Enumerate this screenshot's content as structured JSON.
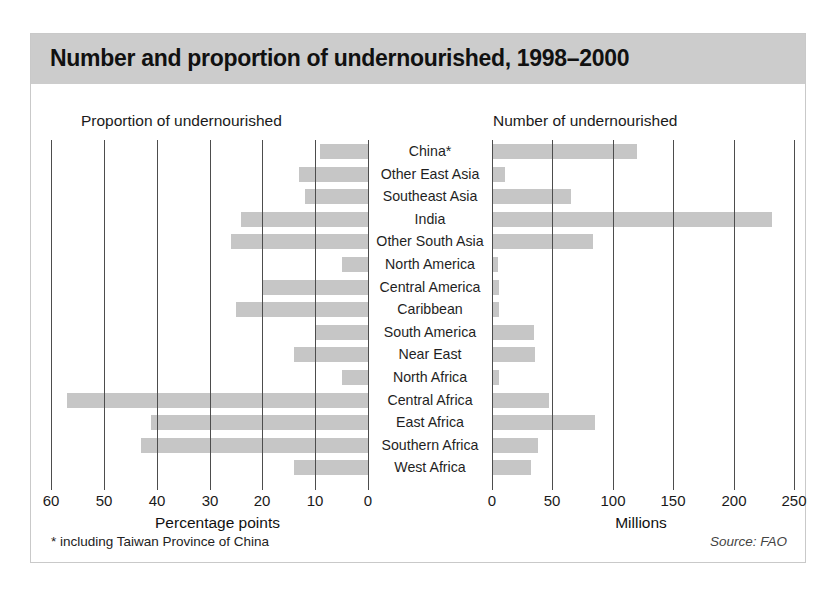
{
  "figure": {
    "title": "Number and proportion of undernourished, 1998–2000",
    "footnote": "* including Taiwan Province of China",
    "source": "Source: FAO",
    "title_band_color": "#cccccc",
    "bar_color": "#c6c6c6",
    "axis_color": "#4d4d4d"
  },
  "panels": {
    "left_heading": "Proportion of undernourished",
    "right_heading": "Number of undernourished"
  },
  "chart_data": {
    "type": "bar",
    "title": "Number and proportion of undernourished, 1998–2000",
    "orientation": "horizontal",
    "layout": "back-to-back bidirectional; left axis reversed, labels centered",
    "grid": true,
    "legend": null,
    "categories": [
      "China*",
      "Other East Asia",
      "Southeast Asia",
      "India",
      "Other South Asia",
      "North America",
      "Central America",
      "Caribbean",
      "South America",
      "Near East",
      "North Africa",
      "Central Africa",
      "East Africa",
      "Southern Africa",
      "West Africa"
    ],
    "series": [
      {
        "name": "Proportion of undernourished",
        "panel": "left",
        "xlabel": "Percentage points",
        "unit": "percentage points",
        "xlim": [
          60,
          0
        ],
        "reversed": true,
        "ticks": [
          60,
          50,
          40,
          30,
          20,
          10,
          0
        ],
        "values": [
          9,
          13,
          12,
          24,
          26,
          5,
          20,
          25,
          10,
          14,
          5,
          57,
          41,
          43,
          14
        ]
      },
      {
        "name": "Number of undernourished",
        "panel": "right",
        "xlabel": "Millions",
        "unit": "millions",
        "xlim": [
          0,
          260
        ],
        "reversed": false,
        "ticks": [
          0,
          50,
          100,
          150,
          200,
          250
        ],
        "values": [
          120,
          11,
          65,
          232,
          84,
          5,
          6,
          6,
          35,
          36,
          6,
          47,
          85,
          38,
          32
        ]
      }
    ]
  }
}
